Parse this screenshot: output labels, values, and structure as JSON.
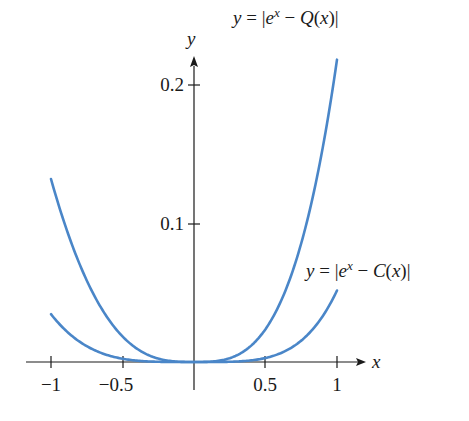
{
  "chart_data": {
    "type": "line",
    "title": "",
    "xlabel": "x",
    "ylabel": "y",
    "xlim": [
      -1,
      1
    ],
    "ylim": [
      0,
      0.22
    ],
    "grid": false,
    "legend_position": "inline annotations",
    "x_ticks": [
      -1,
      -0.5,
      0.5,
      1
    ],
    "x_tick_labels": [
      "−1",
      "−0.5",
      "0.5",
      "1"
    ],
    "y_ticks": [
      0.1,
      0.2
    ],
    "y_tick_labels": [
      "0.1",
      "0.2"
    ],
    "x": [
      -1,
      -0.9,
      -0.8,
      -0.7,
      -0.6,
      -0.5,
      -0.4,
      -0.3,
      -0.2,
      -0.1,
      0,
      0.1,
      0.2,
      0.3,
      0.4,
      0.5,
      0.6,
      0.7,
      0.8,
      0.9,
      1
    ],
    "series": [
      {
        "name": "y = |e^x − Q(x)|",
        "values": [
          0.132,
          0.1034,
          0.0807,
          0.0618,
          0.0488,
          0.0185,
          0.0097,
          0.0042,
          0.0013,
          0.0002,
          0,
          0.0002,
          0.0014,
          0.0049,
          0.0118,
          0.0237,
          0.0421,
          0.0688,
          0.1055,
          0.1546,
          0.2183
        ],
        "color": "#4a86c8"
      },
      {
        "name": "y = |e^x − C(x)|",
        "values": [
          0.0345,
          0.0256,
          0.0186,
          0.0131,
          0.0088,
          0.0057,
          0.0033,
          0.0017,
          0.0007,
          0.0001,
          0,
          0.0001,
          0.0002,
          0.0009,
          0.0018,
          0.0029,
          0.0053,
          0.0115,
          0.0198,
          0.0331,
          0.0516
        ],
        "color": "#4a86c8"
      }
    ],
    "annotations": [
      {
        "text": "y = |e^x − Q(x)|",
        "near": "top right of Q curve"
      },
      {
        "text": "y = |e^x − C(x)|",
        "near": "right end of C curve"
      }
    ]
  },
  "labels": {
    "x_axis": "x",
    "y_axis": "y",
    "q_label_y": "y",
    "q_label_eq": " = |",
    "q_label_e": "e",
    "q_label_sup": "x",
    "q_label_rest": " − ",
    "q_label_fn": "Q",
    "q_label_arg": "(",
    "q_label_argx": "x",
    "q_label_close": ")|",
    "c_label_y": "y",
    "c_label_eq": " = |",
    "c_label_e": "e",
    "c_label_sup": "x",
    "c_label_rest": " − ",
    "c_label_fn": "C",
    "c_label_arg": "(",
    "c_label_argx": "x",
    "c_label_close": ")|",
    "xt0": "−1",
    "xt1": "−0.5",
    "xt2": "0.5",
    "xt3": "1",
    "yt0": "0.1",
    "yt1": "0.2"
  }
}
